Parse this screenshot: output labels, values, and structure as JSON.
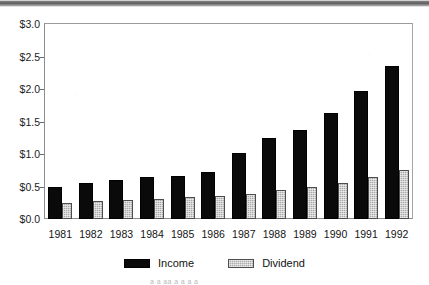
{
  "artifacts": {
    "top_strip": "",
    "bottom_caption_text": "a    a  aa a a     a        a"
  },
  "chart_data": {
    "type": "bar",
    "title": "",
    "subtitle": "",
    "xlabel": "",
    "ylabel": "",
    "categories": [
      "1981",
      "1982",
      "1983",
      "1984",
      "1985",
      "1986",
      "1987",
      "1988",
      "1989",
      "1990",
      "1991",
      "1992"
    ],
    "series": [
      {
        "name": "Income",
        "color": "#0a0a0a",
        "values": [
          0.5,
          0.55,
          0.6,
          0.65,
          0.66,
          0.72,
          1.02,
          1.25,
          1.37,
          1.63,
          1.97,
          2.35
        ]
      },
      {
        "name": "Dividend",
        "color": "#a9a9a9",
        "values": [
          0.25,
          0.28,
          0.29,
          0.31,
          0.34,
          0.35,
          0.39,
          0.45,
          0.49,
          0.55,
          0.64,
          0.75
        ]
      }
    ],
    "ylim": [
      0.0,
      3.0
    ],
    "ytick_values": [
      3.0,
      2.5,
      2.0,
      1.5,
      1.0,
      0.5,
      0.0
    ],
    "ytick_labels": [
      "$3.0",
      "$2.5",
      "$2.0",
      "$1.5",
      "$1.0",
      "$0.5",
      "$0.0"
    ],
    "grid": false,
    "legend_position": "bottom-center",
    "legend_entries": [
      "Income",
      "Dividend"
    ]
  }
}
